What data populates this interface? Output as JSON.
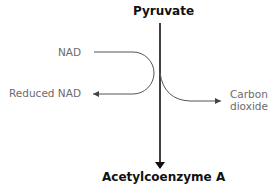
{
  "diagram": {
    "title_top": "Pyruvate",
    "title_bottom": "Acetylcoenzyme A",
    "inputs": [
      {
        "label": "NAD"
      }
    ],
    "outputs": [
      {
        "label": "Reduced NAD"
      },
      {
        "label_line1": "Carbon",
        "label_line2": "dioxide"
      }
    ],
    "colors": {
      "main_arrow": "#111111",
      "side_arrow": "#555555",
      "side_text": "#6b6b6b"
    }
  }
}
